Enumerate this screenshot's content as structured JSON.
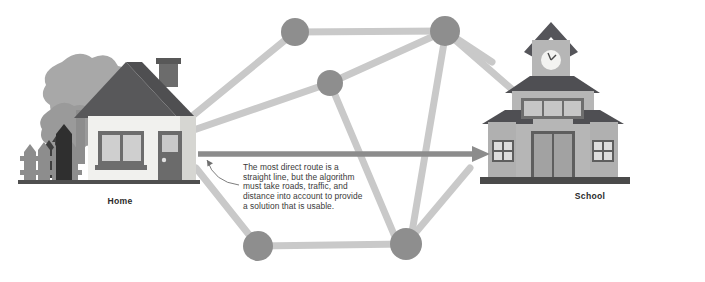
{
  "figure": {
    "width": 705,
    "height": 282,
    "background_color": "#ffffff"
  },
  "labels": {
    "home": "Home",
    "school": "School"
  },
  "callout": {
    "line1": "The most direct route is a",
    "line2": "straight line, but the algorithm",
    "line3": "must take roads, traffic, and",
    "line4": "distance into account to provide",
    "line5": "a solution that is usable."
  },
  "colors": {
    "road": "#c9c9c9",
    "node": "#8e8e8e",
    "arrow": "#8c8c8c",
    "roof_dark": "#5a5a5a",
    "wall_light": "#f2f2ef",
    "wall_mid": "#b9b9b9",
    "tree": "#9a9a9a",
    "tree_light": "#b4b4b4",
    "text": "#3a3a3a",
    "label_text": "#2b2b2b",
    "window_glass": "#cfcfcf",
    "trim_dark": "#4a4a4a"
  },
  "graph": {
    "nodes": [
      {
        "id": "n1",
        "name": "node-top-left",
        "cx": 295,
        "cy": 32,
        "r": 14
      },
      {
        "id": "n2",
        "name": "node-top-right",
        "cx": 445,
        "cy": 31,
        "r": 15
      },
      {
        "id": "n3",
        "name": "node-center",
        "cx": 330,
        "cy": 83,
        "r": 13
      },
      {
        "id": "n4",
        "name": "node-bottom-left",
        "cx": 258,
        "cy": 246,
        "r": 15
      },
      {
        "id": "n5",
        "name": "node-bottom-right",
        "cx": 406,
        "cy": 244,
        "r": 16
      }
    ],
    "edges": [
      {
        "name": "edge-n1-n2",
        "from": "n1",
        "to": "n2"
      },
      {
        "name": "edge-n2-n3",
        "from": "n3",
        "to": "n2"
      },
      {
        "name": "edge-n1-house",
        "from": "n1",
        "to": "house"
      },
      {
        "name": "edge-n3-house",
        "from": "n3",
        "to": "house"
      },
      {
        "name": "edge-n2-school",
        "from": "n2",
        "to": "school"
      },
      {
        "name": "edge-n2-n5",
        "from": "n2",
        "to": "n5"
      },
      {
        "name": "edge-n2-right",
        "from": "n2",
        "to": "right-edge"
      },
      {
        "name": "edge-n3-n5",
        "from": "n3",
        "to": "n5"
      },
      {
        "name": "edge-n4-n5",
        "from": "n4",
        "to": "n5"
      },
      {
        "name": "edge-n4-upleft",
        "from": "n4",
        "to": "upper-left"
      },
      {
        "name": "edge-n5-upright",
        "from": "n5",
        "to": "upper-right"
      }
    ]
  },
  "arrow": {
    "name": "direct-route-arrow",
    "from_x": 200,
    "from_y": 154,
    "to_x": 490,
    "to_y": 154,
    "label": "direct straight-line route"
  },
  "house": {
    "name": "home-illustration",
    "parts": [
      "roof",
      "chimney",
      "walls",
      "window",
      "door",
      "trees",
      "fence"
    ]
  },
  "school": {
    "name": "school-illustration",
    "parts": [
      "bell-tower",
      "clock",
      "main-roof",
      "wings",
      "windows",
      "double-door",
      "base"
    ]
  }
}
